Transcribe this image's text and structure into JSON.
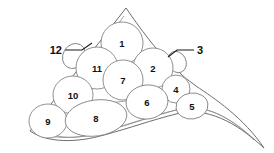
{
  "figure": {
    "background_color": "#ffffff",
    "outline_color": "#5d5d5d",
    "lobe_fill": "#ffffff",
    "lobe_stroke": "#7c7c7c",
    "label_color": "#111111"
  },
  "outline": {
    "name": "tapered-triangular-boundary",
    "outer_path": "M 126 8 L 264 148 L 256 140 L 206 112 L 176 99 L 140 96 L 104 104 L 62 119 L 36 134 L 30 131 L 44 118 Z",
    "body_path": "M 126 8 L 30 131 C 48 143 76 143 104 135 C 130 128 152 120 176 114 C 206 106 236 122 264 148 C 244 118 214 98 196 86 C 170 68 148 40 126 8 Z",
    "inner_edge_path": "M 124 16 L 40 130 C 58 140 82 139 106 131 C 132 124 152 116 176 110 C 204 102 232 118 256 141",
    "ridge_path": "M 36 132 C 56 140 80 139 104 131 C 130 124 152 116 176 110 C 204 102 230 117 254 140",
    "keel_path": "M 104 104 C 126 100 150 99 176 100"
  },
  "lobes": [
    {
      "id": "lobe-1",
      "label": "1",
      "cx": 122,
      "cy": 43,
      "rx": 21,
      "ry": 21,
      "rot": 0
    },
    {
      "id": "lobe-2",
      "label": "2",
      "cx": 153,
      "cy": 68,
      "rx": 20,
      "ry": 20,
      "rot": 0
    },
    {
      "id": "lobe-3",
      "label": "3",
      "cx": 177,
      "cy": 62,
      "rx": 9,
      "ry": 11,
      "rot": -25
    },
    {
      "id": "lobe-4",
      "label": "4",
      "cx": 176,
      "cy": 89,
      "rx": 14,
      "ry": 14,
      "rot": 0
    },
    {
      "id": "lobe-5",
      "label": "5",
      "cx": 192,
      "cy": 106,
      "rx": 16,
      "ry": 13,
      "rot": -8
    },
    {
      "id": "lobe-6",
      "label": "6",
      "cx": 147,
      "cy": 102,
      "rx": 21,
      "ry": 17,
      "rot": -8
    },
    {
      "id": "lobe-7",
      "label": "7",
      "cx": 123,
      "cy": 80,
      "rx": 20,
      "ry": 20,
      "rot": 0
    },
    {
      "id": "lobe-8",
      "label": "8",
      "cx": 96,
      "cy": 118,
      "rx": 31,
      "ry": 18,
      "rot": -8
    },
    {
      "id": "lobe-9",
      "label": "9",
      "cx": 48,
      "cy": 121,
      "rx": 19,
      "ry": 17,
      "rot": 0
    },
    {
      "id": "lobe-10",
      "label": "10",
      "cx": 73,
      "cy": 95,
      "rx": 20,
      "ry": 19,
      "rot": 0
    },
    {
      "id": "lobe-11",
      "label": "11",
      "cx": 97,
      "cy": 68,
      "rx": 21,
      "ry": 21,
      "rot": 0
    },
    {
      "id": "lobe-12",
      "label": "12",
      "cx": 74,
      "cy": 56,
      "rx": 11,
      "ry": 13,
      "rot": 30
    }
  ],
  "callouts": [
    {
      "id": "callout-12",
      "label": "12",
      "text_x": 62,
      "text_y": 50,
      "side": "left",
      "leader_path": "M 65 50 L 82 50 L 92 43"
    },
    {
      "id": "callout-3",
      "label": "3",
      "text_x": 197,
      "text_y": 50,
      "side": "right",
      "leader_path": "M 194 50 L 177 50 L 168 57"
    }
  ]
}
